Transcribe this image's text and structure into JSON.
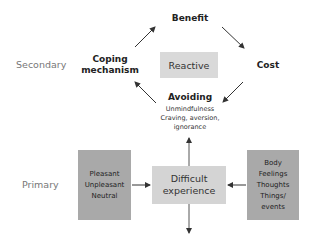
{
  "diagram": {
    "levels": {
      "secondary": "Secondary",
      "primary": "Primary"
    },
    "cycle": {
      "center": "Reactive",
      "nodes": {
        "top": "Benefit",
        "right": "Cost",
        "bottom": "Avoiding",
        "left_line1": "Coping",
        "left_line2": "mechanism"
      },
      "avoiding_details": [
        "Unmindfulness",
        "Craving, aversion,",
        "ignorance"
      ]
    },
    "primary_row": {
      "left_box": [
        "Pleasant",
        "Unpleasant",
        "Neutral"
      ],
      "center_box": [
        "Difficult",
        "experience"
      ],
      "right_box": [
        "Body",
        "Feelings",
        "Thoughts",
        "Things/",
        "events"
      ]
    },
    "colors": {
      "reactive_box": "#d9d9d9",
      "center_box": "#d4d4d4",
      "side_boxes": "#a9a9a9",
      "arrows": "#333333",
      "level_labels": "#777777"
    }
  }
}
